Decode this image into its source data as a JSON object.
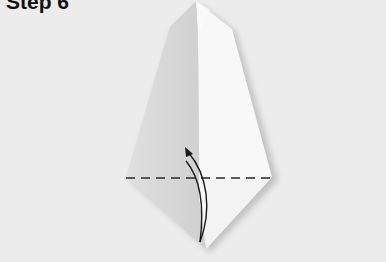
{
  "title": "Step 6",
  "figure": {
    "colors": {
      "background": "#ececec",
      "paper_light": "#f7f7f7",
      "paper_shade": "#d4d4d4",
      "shadow": "#9a9a9a",
      "lines": "#222222"
    },
    "fold_line": {
      "style": "dashed",
      "y": 178,
      "x_start": 126,
      "x_end": 272
    },
    "arrow": {
      "direction": "up",
      "meaning": "fold bottom point upward"
    }
  }
}
